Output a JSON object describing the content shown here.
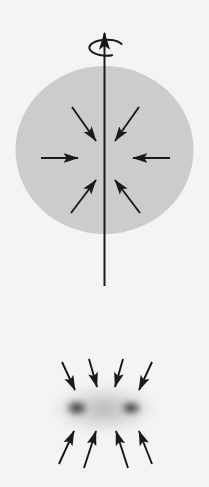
{
  "figure": {
    "title": "Rotating cloud collapse and binary fragmentation",
    "width": 209,
    "height": 487,
    "background_color": "#f4f4f4",
    "ink_color": "#1a1a1a",
    "panels": [
      {
        "id": "panel-top",
        "name": "rotating-collapsing-sphere",
        "description": "Uniform gray sphere with a vertical rotation axis and inward-pointing collapse arrows",
        "sphere": {
          "fill_color": "#cccccc",
          "center_x": 104.5,
          "center_y": 150,
          "radius_x": 89,
          "radius_y": 84
        },
        "rotation_axis": {
          "name": "rotation-axis",
          "x": 104.5,
          "y_top": 30,
          "y_bottom": 286,
          "stroke_width": 2.0,
          "arrowhead": "up"
        },
        "spin_indicator": {
          "name": "spin-ellipse",
          "center_x": 104.5,
          "center_y": 48,
          "radius_x": 17,
          "radius_y": 8,
          "stroke_width": 2.0,
          "direction": "counter-clockwise"
        },
        "collapse_arrows": [
          {
            "id": "arrow-w",
            "angle_deg": 0,
            "x1": 41,
            "y1": 158,
            "x2": 77,
            "y2": 158
          },
          {
            "id": "arrow-e",
            "angle_deg": 180,
            "x1": 170,
            "y1": 158,
            "x2": 134,
            "y2": 158
          },
          {
            "id": "arrow-nw",
            "angle_deg": 315,
            "x1": 72,
            "y1": 108,
            "x2": 95,
            "y2": 140
          },
          {
            "id": "arrow-ne",
            "angle_deg": 225,
            "x1": 139,
            "y1": 108,
            "x2": 116,
            "y2": 140
          },
          {
            "id": "arrow-sw",
            "angle_deg": 45,
            "x1": 72,
            "y1": 212,
            "x2": 95,
            "y2": 181
          },
          {
            "id": "arrow-se",
            "angle_deg": 135,
            "x1": 139,
            "y1": 212,
            "x2": 116,
            "y2": 181
          }
        ]
      },
      {
        "id": "panel-bottom",
        "name": "binary-fragmentation",
        "description": "Two dense cores embedded in a diffuse halo with inward-pointing accretion arrows",
        "halo": {
          "name": "diffuse-halo",
          "center_x": 104,
          "center_y": 409,
          "radius_x": 60,
          "radius_y": 28,
          "color": "#bdbdbd"
        },
        "cores": [
          {
            "id": "core-left",
            "center_x": 77,
            "center_y": 408,
            "radius_x": 15,
            "radius_y": 11,
            "color": "#4a4a4a"
          },
          {
            "id": "core-right",
            "center_x": 131,
            "center_y": 408,
            "radius_x": 14,
            "radius_y": 10,
            "color": "#4a4a4a"
          }
        ],
        "infall_arrows_top": [
          {
            "id": "arrow-t1",
            "x1": 62,
            "y1": 363,
            "x2": 74,
            "y2": 389
          },
          {
            "id": "arrow-t2",
            "x1": 88,
            "y1": 360,
            "x2": 96,
            "y2": 386
          },
          {
            "id": "arrow-t3",
            "x1": 124,
            "y1": 360,
            "x2": 116,
            "y2": 386
          },
          {
            "id": "arrow-t4",
            "x1": 152,
            "y1": 363,
            "x2": 139,
            "y2": 389
          }
        ],
        "infall_arrows_bottom": [
          {
            "id": "arrow-b1",
            "x1": 60,
            "y1": 462,
            "x2": 74,
            "y2": 432
          },
          {
            "id": "arrow-b2",
            "x1": 84,
            "y1": 466,
            "x2": 95,
            "y2": 432
          },
          {
            "id": "arrow-b3",
            "x1": 127,
            "y1": 466,
            "x2": 116,
            "y2": 432
          },
          {
            "id": "arrow-b4",
            "x1": 151,
            "y1": 462,
            "x2": 138,
            "y2": 432
          }
        ]
      }
    ]
  }
}
